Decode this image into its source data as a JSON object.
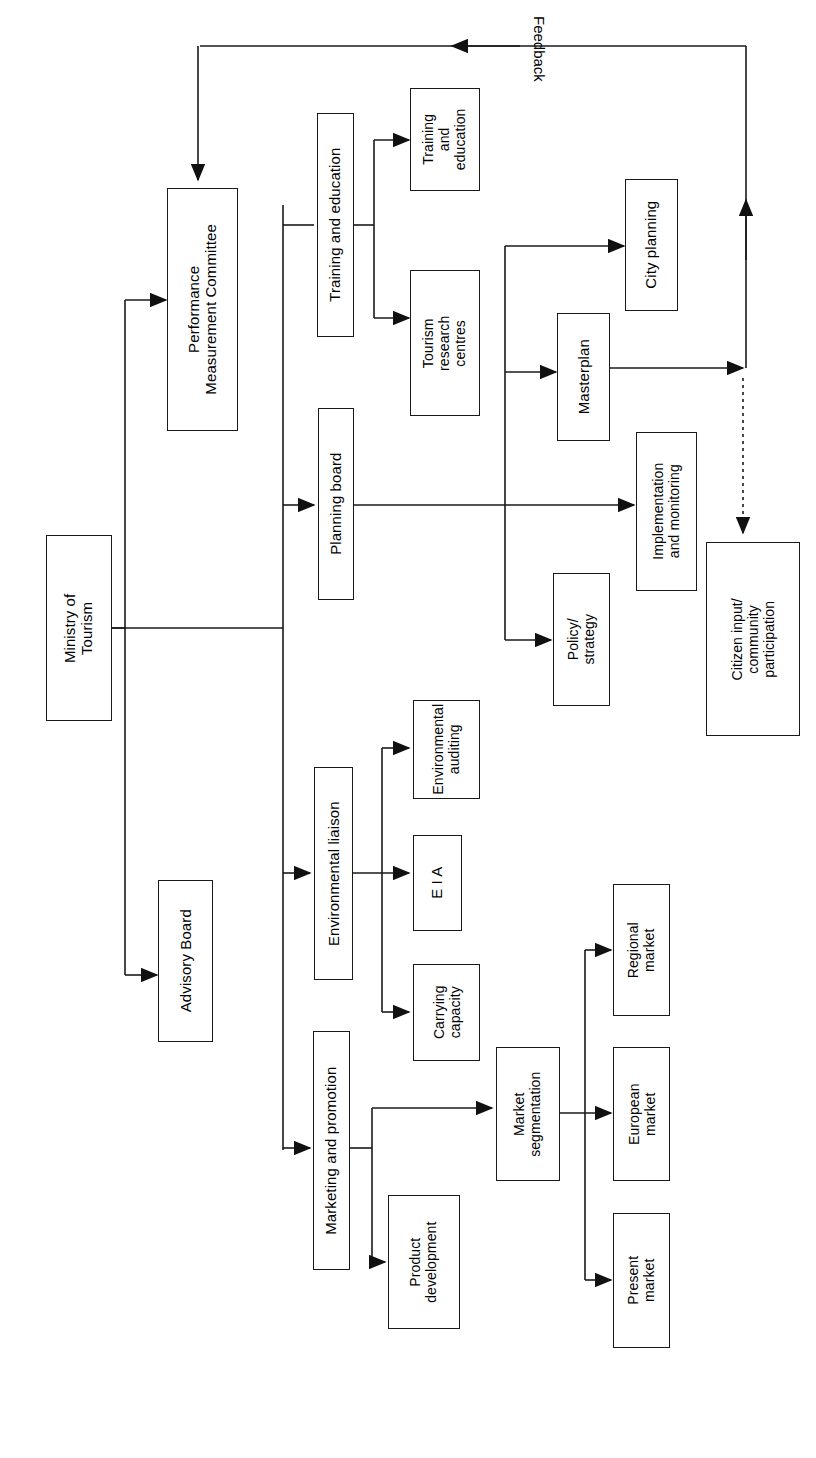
{
  "diagram": {
    "orientation": "rotated-90-landscape",
    "stroke_color": "#1a1a1a",
    "background_color": "#ffffff",
    "feedback_label": "Feedback",
    "nodes": {
      "ministry_of_tourism": "Ministry of\nTourism",
      "performance_measurement_committee": "Performance\nMeasurement Committee",
      "advisory_board": "Advisory Board",
      "training_and_education_unit": "Training and education",
      "planning_board": "Planning board",
      "environmental_liaison": "Environmental liaison",
      "marketing_and_promotion": "Marketing and promotion",
      "training_and_education_leaf": "Training\nand\neducation",
      "tourism_research_centres": "Tourism\nresearch\ncentres",
      "city_planning": "City planning",
      "masterplan": "Masterplan",
      "policy_strategy": "Policy/\nstrategy",
      "implementation_and_monitoring": "Implementation\nand monitoring",
      "citizen_input": "Citizen input/\ncommunity\nparticipation",
      "environmental_auditing": "Environmental\nauditing",
      "eia": "E I A",
      "carrying_capacity": "Carrying\ncapacity",
      "product_development": "Product\ndevelopment",
      "market_segmentation": "Market\nsegmentation",
      "regional_market": "Regional\nmarket",
      "european_market": "European\nmarket",
      "present_market": "Present\nmarket"
    }
  }
}
